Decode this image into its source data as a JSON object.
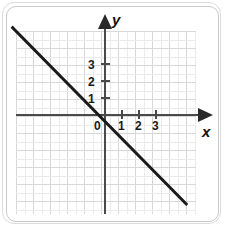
{
  "figure": {
    "type": "coordinate-plane-graph",
    "background_color": "#ffffff",
    "frame_color": "#cccccc"
  },
  "axes": {
    "x_name": "x",
    "y_name": "y",
    "origin_label": "0",
    "axis_color": "#4a4a4a",
    "arrow_color": "#2a2a2a",
    "x_tick_labels": [
      "1",
      "2",
      "3"
    ],
    "y_tick_labels": [
      "1",
      "2",
      "3"
    ]
  },
  "grid": {
    "cell_size_px": 17,
    "major_color": "#d8d8d8",
    "minor_color": "#ebebeb",
    "columns": 11,
    "rows": 11
  },
  "chart_data": {
    "type": "line",
    "title": "",
    "xlabel": "x",
    "ylabel": "y",
    "grid": true,
    "legend": false,
    "xlim": [
      -5,
      6
    ],
    "ylim": [
      -6,
      5
    ],
    "xticks": [
      1,
      2,
      3
    ],
    "yticks": [
      1,
      2,
      3
    ],
    "series": [
      {
        "name": "y = -x",
        "color": "#1a1a1a",
        "line_width": 3,
        "slope": -1,
        "intercept": 0,
        "x": [
          -5.2,
          5.4
        ],
        "y": [
          5.2,
          -5.4
        ],
        "points": [
          {
            "x": -5.2,
            "y": 5.2
          },
          {
            "x": 0,
            "y": 0
          },
          {
            "x": 5.4,
            "y": -5.4
          }
        ]
      }
    ]
  }
}
